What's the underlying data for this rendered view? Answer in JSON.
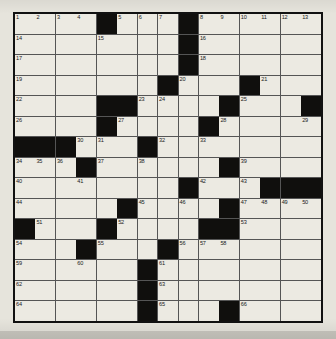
{
  "puzzle": {
    "title": "Crossword Puzzle Grid",
    "size": {
      "rows": 15,
      "cols": 15
    },
    "colors": {
      "paper": "#e6e4dc",
      "cell_white": "#eceae2",
      "cell_black": "#100f0d",
      "grid_line": "#555555",
      "border": "#111111",
      "number_text": "#1a1a1a"
    },
    "black_cells": [
      [
        1,
        5
      ],
      [
        1,
        9
      ],
      [
        2,
        9
      ],
      [
        3,
        9
      ],
      [
        4,
        8
      ],
      [
        4,
        12
      ],
      [
        5,
        5
      ],
      [
        5,
        6
      ],
      [
        5,
        11
      ],
      [
        5,
        15
      ],
      [
        6,
        5
      ],
      [
        6,
        10
      ],
      [
        7,
        1
      ],
      [
        7,
        2
      ],
      [
        7,
        3
      ],
      [
        7,
        7
      ],
      [
        8,
        4
      ],
      [
        8,
        11
      ],
      [
        9,
        9
      ],
      [
        9,
        13
      ],
      [
        9,
        14
      ],
      [
        9,
        15
      ],
      [
        10,
        6
      ],
      [
        10,
        11
      ],
      [
        11,
        1
      ],
      [
        11,
        5
      ],
      [
        11,
        10
      ],
      [
        11,
        11
      ],
      [
        12,
        4
      ],
      [
        12,
        8
      ],
      [
        13,
        7
      ],
      [
        14,
        7
      ],
      [
        15,
        7
      ],
      [
        15,
        11
      ]
    ],
    "numbers": [
      {
        "n": 1,
        "row": 1,
        "col": 1
      },
      {
        "n": 2,
        "row": 1,
        "col": 2
      },
      {
        "n": 3,
        "row": 1,
        "col": 3
      },
      {
        "n": 4,
        "row": 1,
        "col": 4
      },
      {
        "n": 5,
        "row": 1,
        "col": 6
      },
      {
        "n": 6,
        "row": 1,
        "col": 7
      },
      {
        "n": 7,
        "row": 1,
        "col": 8
      },
      {
        "n": 8,
        "row": 1,
        "col": 10
      },
      {
        "n": 9,
        "row": 1,
        "col": 11
      },
      {
        "n": 10,
        "row": 1,
        "col": 12
      },
      {
        "n": 11,
        "row": 1,
        "col": 13
      },
      {
        "n": 12,
        "row": 1,
        "col": 14
      },
      {
        "n": 13,
        "row": 1,
        "col": 15
      },
      {
        "n": 14,
        "row": 2,
        "col": 1
      },
      {
        "n": 15,
        "row": 2,
        "col": 5
      },
      {
        "n": 16,
        "row": 2,
        "col": 10
      },
      {
        "n": 17,
        "row": 3,
        "col": 1
      },
      {
        "n": 18,
        "row": 3,
        "col": 10
      },
      {
        "n": 19,
        "row": 4,
        "col": 1
      },
      {
        "n": 20,
        "row": 4,
        "col": 9
      },
      {
        "n": 21,
        "row": 4,
        "col": 13
      },
      {
        "n": 22,
        "row": 5,
        "col": 1
      },
      {
        "n": 23,
        "row": 5,
        "col": 7
      },
      {
        "n": 24,
        "row": 5,
        "col": 8
      },
      {
        "n": 25,
        "row": 5,
        "col": 12
      },
      {
        "n": 26,
        "row": 6,
        "col": 1
      },
      {
        "n": 27,
        "row": 6,
        "col": 6
      },
      {
        "n": 28,
        "row": 6,
        "col": 11
      },
      {
        "n": 29,
        "row": 6,
        "col": 15
      },
      {
        "n": 30,
        "row": 7,
        "col": 4
      },
      {
        "n": 31,
        "row": 7,
        "col": 5
      },
      {
        "n": 32,
        "row": 7,
        "col": 8
      },
      {
        "n": 33,
        "row": 7,
        "col": 10
      },
      {
        "n": 34,
        "row": 8,
        "col": 1
      },
      {
        "n": 35,
        "row": 8,
        "col": 2
      },
      {
        "n": 36,
        "row": 8,
        "col": 3
      },
      {
        "n": 37,
        "row": 8,
        "col": 5
      },
      {
        "n": 38,
        "row": 8,
        "col": 7
      },
      {
        "n": 39,
        "row": 8,
        "col": 12
      },
      {
        "n": 40,
        "row": 9,
        "col": 1
      },
      {
        "n": 41,
        "row": 9,
        "col": 4
      },
      {
        "n": 42,
        "row": 9,
        "col": 10
      },
      {
        "n": 43,
        "row": 9,
        "col": 12
      },
      {
        "n": 44,
        "row": 10,
        "col": 1
      },
      {
        "n": 45,
        "row": 10,
        "col": 7
      },
      {
        "n": 46,
        "row": 10,
        "col": 9
      },
      {
        "n": 47,
        "row": 10,
        "col": 12
      },
      {
        "n": 48,
        "row": 10,
        "col": 13
      },
      {
        "n": 49,
        "row": 10,
        "col": 14
      },
      {
        "n": 50,
        "row": 10,
        "col": 15
      },
      {
        "n": 51,
        "row": 11,
        "col": 2
      },
      {
        "n": 52,
        "row": 11,
        "col": 6
      },
      {
        "n": 53,
        "row": 11,
        "col": 12
      },
      {
        "n": 54,
        "row": 12,
        "col": 1
      },
      {
        "n": 55,
        "row": 12,
        "col": 5
      },
      {
        "n": 56,
        "row": 12,
        "col": 9
      },
      {
        "n": 57,
        "row": 12,
        "col": 10
      },
      {
        "n": 58,
        "row": 12,
        "col": 11
      },
      {
        "n": 59,
        "row": 13,
        "col": 1
      },
      {
        "n": 60,
        "row": 13,
        "col": 4
      },
      {
        "n": 61,
        "row": 13,
        "col": 8
      },
      {
        "n": 62,
        "row": 14,
        "col": 1
      },
      {
        "n": 63,
        "row": 14,
        "col": 8
      },
      {
        "n": 64,
        "row": 15,
        "col": 1
      },
      {
        "n": 65,
        "row": 15,
        "col": 8
      },
      {
        "n": 66,
        "row": 15,
        "col": 12
      }
    ]
  }
}
